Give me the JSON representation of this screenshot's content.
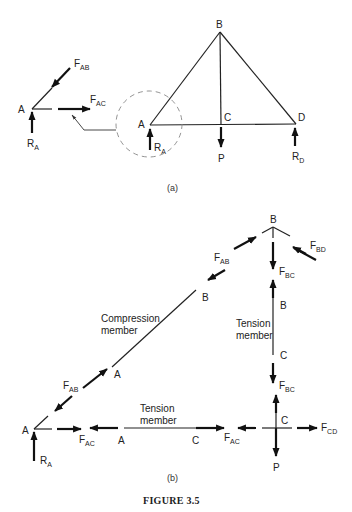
{
  "figure": {
    "caption": "FIGURE 3.5",
    "part_a_label": "(a)",
    "part_b_label": "(b)"
  },
  "part_a": {
    "nodes": {
      "A": "A",
      "B": "B",
      "C": "C",
      "D": "D"
    },
    "loads": {
      "RA": "R",
      "RA_sub": "A",
      "RD": "R",
      "RD_sub": "D",
      "P": "P"
    },
    "joint_fbd": {
      "node": "A",
      "fab": "F",
      "fab_sub": "AB",
      "fac": "F",
      "fac_sub": "AC",
      "ra": "R",
      "ra_sub": "A"
    }
  },
  "part_b": {
    "compression_label_1": "Compression",
    "compression_label_2": "member",
    "tension_vertical_1": "Tension",
    "tension_vertical_2": "member",
    "tension_horizontal_1": "Tension",
    "tension_horizontal_2": "member",
    "nodes": {
      "A_joint": "A",
      "B_joint": "B",
      "C_joint": "C",
      "A_member_ab": "A",
      "B_member_ab": "B",
      "B_member_bc": "B",
      "C_member_bc": "C",
      "A_member_ac": "A",
      "C_member_ac": "C"
    },
    "forces": {
      "F": "F",
      "AB": "AB",
      "AC": "AC",
      "BC": "BC",
      "BD": "BD",
      "CD": "CD",
      "R": "R",
      "RA_sub": "A",
      "P": "P"
    }
  }
}
